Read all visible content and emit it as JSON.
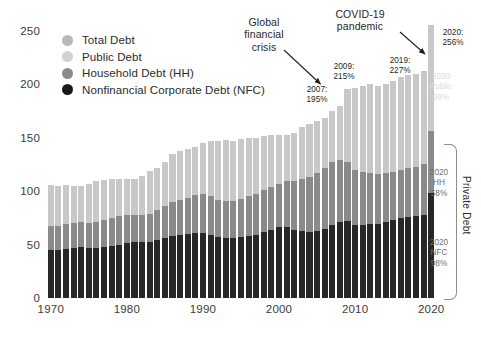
{
  "chart_data": {
    "type": "bar",
    "title": "",
    "subtitle": "",
    "xlabel": "",
    "ylabel": "",
    "stacked": true,
    "grid": false,
    "legend_position": "top-left",
    "ylim": [
      0,
      260
    ],
    "yticks": [
      0,
      50,
      100,
      150,
      200,
      250
    ],
    "xticks": [
      1970,
      1980,
      1990,
      2000,
      2010,
      2020
    ],
    "xlim": [
      1969.3,
      2020.7
    ],
    "categories": [
      1970,
      1971,
      1972,
      1973,
      1974,
      1975,
      1976,
      1977,
      1978,
      1979,
      1980,
      1981,
      1982,
      1983,
      1984,
      1985,
      1986,
      1987,
      1988,
      1989,
      1990,
      1991,
      1992,
      1993,
      1994,
      1995,
      1996,
      1997,
      1998,
      1999,
      2000,
      2001,
      2002,
      2003,
      2004,
      2005,
      2006,
      2007,
      2008,
      2009,
      2010,
      2011,
      2012,
      2013,
      2014,
      2015,
      2016,
      2017,
      2018,
      2019,
      2020
    ],
    "series": [
      {
        "name": "Nonfinancial Corporate Debt (NFC)",
        "color": "#272727",
        "values": [
          45,
          45,
          46,
          47,
          48,
          47,
          47,
          48,
          49,
          50,
          51,
          52,
          52,
          52,
          54,
          56,
          58,
          59,
          60,
          61,
          61,
          59,
          57,
          56,
          56,
          57,
          58,
          59,
          62,
          64,
          66,
          66,
          64,
          63,
          62,
          63,
          65,
          68,
          71,
          72,
          68,
          68,
          69,
          69,
          71,
          73,
          75,
          76,
          77,
          78,
          98
        ]
      },
      {
        "name": "Household Debt (HH)",
        "color": "#8a8a8a",
        "values": [
          22,
          22,
          23,
          23,
          23,
          23,
          24,
          25,
          26,
          27,
          27,
          26,
          26,
          27,
          28,
          30,
          32,
          33,
          34,
          35,
          36,
          36,
          35,
          35,
          35,
          36,
          37,
          38,
          39,
          40,
          41,
          43,
          45,
          48,
          51,
          54,
          57,
          59,
          58,
          55,
          52,
          50,
          48,
          47,
          46,
          45,
          45,
          46,
          46,
          47,
          58
        ]
      },
      {
        "name": "Public Debt",
        "color": "#c8c8c8",
        "values": [
          38,
          37,
          36,
          34,
          33,
          36,
          38,
          37,
          36,
          34,
          33,
          33,
          36,
          39,
          39,
          41,
          44,
          45,
          45,
          45,
          47,
          51,
          54,
          56,
          55,
          55,
          54,
          52,
          50,
          48,
          45,
          43,
          45,
          48,
          49,
          48,
          46,
          47,
          50,
          68,
          76,
          80,
          83,
          82,
          83,
          84,
          86,
          86,
          86,
          87,
          99
        ]
      }
    ],
    "totals_labeled": [
      {
        "year": 2007,
        "label": "2007:\n195%",
        "value": 195
      },
      {
        "year": 2009,
        "label": "2009:\n215%",
        "value": 215
      },
      {
        "year": 2019,
        "label": "2019:\n227%",
        "value": 227
      },
      {
        "year": 2020,
        "label": "2020:\n256%",
        "value": 256
      }
    ],
    "annotations": [
      {
        "name": "global-financial-crisis",
        "text": "Global\nfinancial\ncrisis"
      },
      {
        "name": "covid-19-pandemic",
        "text": "COVID-19\npandemic"
      }
    ],
    "endpoint_labels": [
      {
        "name": "public-2020",
        "text": "2020\nPublic\n99%",
        "series": "Public Debt"
      },
      {
        "name": "hh-2020",
        "text": "2020\nHH\n58%",
        "series": "Household Debt (HH)"
      },
      {
        "name": "nfc-2020",
        "text": "2020\nNFC\n98%",
        "series": "Nonfinancial Corporate Debt (NFC)"
      }
    ],
    "bracket_label": "Private Debt"
  },
  "legend": {
    "items": [
      {
        "label": "Total Debt",
        "color": "#b9b9b9"
      },
      {
        "label": "Public Debt",
        "color": "#d2d2d2"
      },
      {
        "label": "Household Debt (HH)",
        "color": "#8a8a8a"
      },
      {
        "label": "Nonfinancial Corporate Debt (NFC)",
        "color": "#191919"
      }
    ]
  },
  "axes": {
    "y": [
      "250",
      "200",
      "150",
      "100",
      "50",
      "0"
    ],
    "x": [
      "1970",
      "1980",
      "1990",
      "2000",
      "2010",
      "2020"
    ]
  },
  "annotations": {
    "gfc": "Global\nfinancial\ncrisis",
    "covid": "COVID-19\npandemic",
    "v2007": "2007:\n195%",
    "v2009": "2009:\n215%",
    "v2019": "2019:\n227%",
    "v2020": "2020:\n256%",
    "public2020": "2020\nPublic\n99%",
    "hh2020": "2020\nHH\n58%",
    "nfc2020": "2020\nNFC\n98%",
    "private": "Private Debt"
  }
}
